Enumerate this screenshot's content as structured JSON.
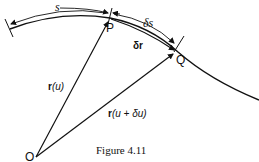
{
  "figure": {
    "caption": "Figure 4.11",
    "points": {
      "P": "P",
      "Q": "Q",
      "O": "O"
    },
    "labels": {
      "arc_length": "s",
      "arc_increment": "δs",
      "chord_vector": "δr",
      "position_u_bold": "r",
      "position_u_rest": "(u)",
      "position_u_du_bold": "r",
      "position_u_du_rest": "(u + δu)"
    },
    "colors": {
      "line": "#111111",
      "background": "#ffffff"
    }
  }
}
